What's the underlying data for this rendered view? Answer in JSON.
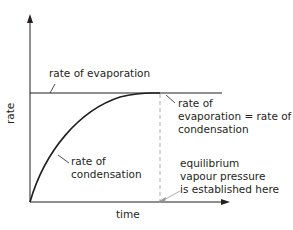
{
  "diagram": {
    "title": "",
    "y_axis_label": "rate",
    "x_axis_label": "time",
    "labels": {
      "evaporation": "rate of evaporation",
      "equal_1": "rate of",
      "equal_2": "evaporation = rate of",
      "equal_3": "condensation",
      "condensation_1": "rate of",
      "condensation_2": "condensation",
      "equilibrium_1": "equilibrium",
      "equilibrium_2": "vapour pressure",
      "equilibrium_3": "is established here"
    },
    "colors": {
      "line": "#231f20",
      "dashed": "#999999"
    }
  }
}
